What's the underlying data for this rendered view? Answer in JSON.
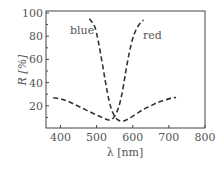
{
  "chart_data": {
    "type": "line",
    "title": "",
    "xlabel": "λ [nm]",
    "ylabel": "R [%]",
    "xlim": [
      360,
      800
    ],
    "ylim": [
      0,
      100
    ],
    "xticks": [
      400,
      500,
      600,
      700,
      800
    ],
    "yticks": [
      20,
      40,
      60,
      80,
      100
    ],
    "grid": false,
    "legend_position": "inline annotations",
    "series": [
      {
        "name": "blue",
        "style": "dashed",
        "color": "#333333",
        "x": [
          480,
          495,
          505,
          515,
          525,
          535,
          545,
          555,
          565,
          575,
          590,
          610,
          630,
          650,
          670,
          690,
          710,
          720
        ],
        "y": [
          95,
          88,
          75,
          58,
          40,
          24,
          14,
          9,
          7,
          7,
          9,
          13,
          17,
          20,
          23,
          25,
          27,
          27
        ]
      },
      {
        "name": "red",
        "style": "dashed",
        "color": "#333333",
        "x": [
          380,
          400,
          420,
          440,
          460,
          480,
          500,
          515,
          530,
          540,
          550,
          560,
          570,
          580,
          590,
          600,
          610,
          620,
          630
        ],
        "y": [
          27,
          26,
          24,
          21,
          18,
          15,
          12,
          10,
          8,
          8,
          11,
          18,
          30,
          48,
          65,
          78,
          86,
          91,
          94
        ]
      }
    ],
    "annotations": [
      {
        "text": "blue",
        "x": 450,
        "y": 84
      },
      {
        "text": "red",
        "x": 612,
        "y": 78
      }
    ]
  },
  "labels": {
    "xlabel": "λ [nm]",
    "ylabel": "R [%]",
    "blue": "blue",
    "red": "red"
  }
}
